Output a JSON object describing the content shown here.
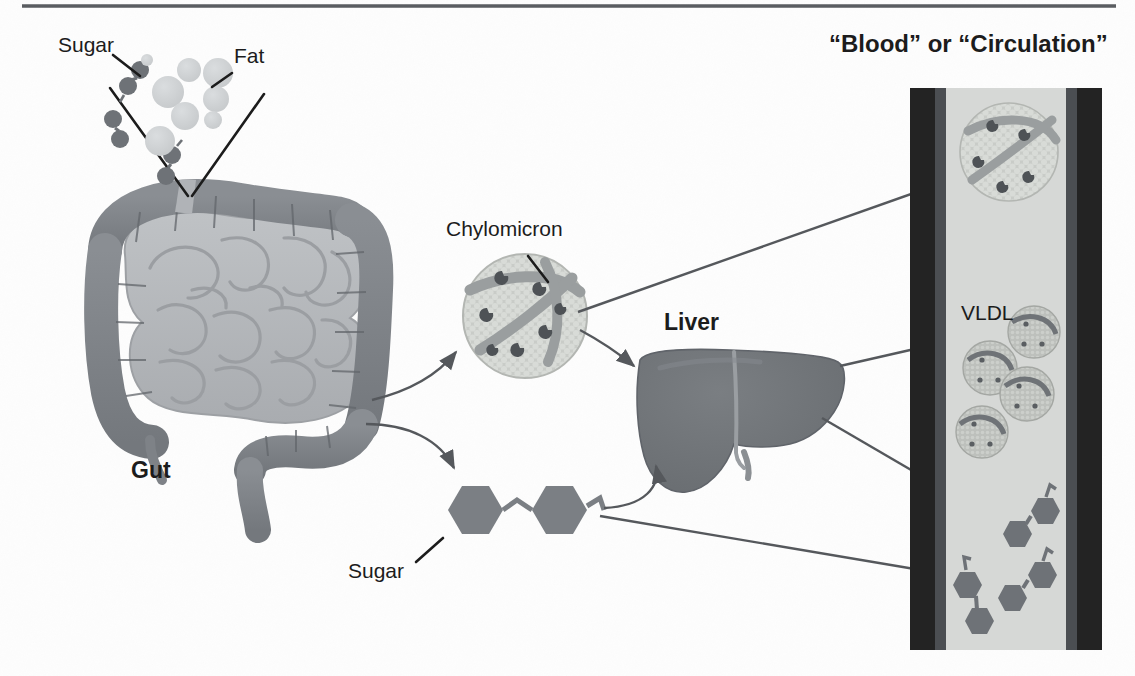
{
  "figure": {
    "title_right": "“Blood” or “Circulation”",
    "background_color": "#fdfdfd",
    "rule_color": "#5a5d61"
  },
  "labels": {
    "sugar_top": "Sugar",
    "fat_top": "Fat",
    "gut": "Gut",
    "chylomicron": "Chylomicron",
    "liver": "Liver",
    "sugar_bottom": "Sugar",
    "vldl": "VLDL"
  },
  "colors": {
    "text": "#1c1c1c",
    "leader_line": "#1c1c1c",
    "flow_arrow": "#55585c",
    "gut_colon": "#7e8287",
    "gut_small_intestine": "#b4b7ba",
    "liver": "#6e7276",
    "sugar_hex": "#7b7f84",
    "fat_droplet": "#cfd2d4",
    "chylomicron_body": "#c9ccc8",
    "chylomicron_band": "#9a9e9f",
    "vessel_wall": "#232323",
    "vessel_wall_inner": "#4b4e52",
    "vessel_lumen": "#d6d8d6"
  },
  "vessel": {
    "x": 910,
    "y": 88,
    "width": 192,
    "height": 562,
    "wall_thickness": 36,
    "contents": {
      "chylomicron_count": 1,
      "vldl_count": 4,
      "sugar_pair_count": 3
    }
  },
  "nutrients_top": {
    "sugar_pairs": 3,
    "fat_droplets": 8
  },
  "sugar_bottom": {
    "hexagon_count": 2,
    "description": "disaccharide"
  },
  "flow": [
    {
      "from": "gut",
      "to": "chylomicron"
    },
    {
      "from": "gut",
      "to": "sugar_bottom"
    },
    {
      "from": "chylomicron",
      "to": "liver"
    },
    {
      "from": "chylomicron",
      "to": "blood_chylomicron"
    },
    {
      "from": "sugar_bottom",
      "to": "liver"
    },
    {
      "from": "liver",
      "to": "blood_vldl"
    },
    {
      "from": "liver",
      "to": "blood_sugar"
    },
    {
      "from": "sugar_bottom",
      "to": "blood_sugar_lower"
    }
  ]
}
